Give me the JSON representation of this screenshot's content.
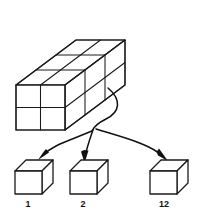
{
  "figure": {
    "type": "math-diagram",
    "stroke_color": "#1a1a1a",
    "background_color": "#ffffff",
    "arrow_color": "#111111"
  },
  "prism": {
    "name": "unit-cube-prism",
    "width_units": 2,
    "height_units": 2,
    "depth_units": 3,
    "total_unit_cubes": 12,
    "front_face_rows": 2,
    "front_face_columns": 2,
    "top_face_columns": 2,
    "top_face_rows": 3
  },
  "arrows": {
    "count": 3,
    "targets": [
      "cube-1",
      "cube-2",
      "cube-12"
    ]
  },
  "unit_cubes": [
    {
      "id": "cube-1",
      "label": "1"
    },
    {
      "id": "cube-2",
      "label": "2"
    },
    {
      "id": "cube-12",
      "label": "12"
    }
  ]
}
